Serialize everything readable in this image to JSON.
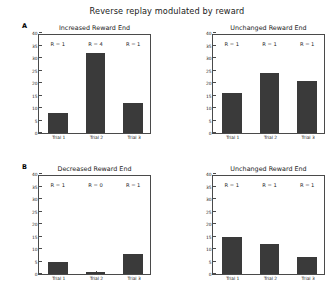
{
  "figure": {
    "suptitle": "Reverse replay modulated by reward",
    "bar_color": "#3a3a3a",
    "axis_color": "#4a4a4a",
    "background": "#ffffff"
  },
  "panels": [
    {
      "letter": "A",
      "position": "top-left",
      "title": "Increased Reward End",
      "ylabel": "No. of reverse replay events",
      "annotations": [
        "R = 1",
        "R = 4",
        "R = 1"
      ]
    },
    {
      "letter": "",
      "position": "top-right",
      "title": "Unchanged Reward End",
      "ylabel": "No. of reverse replay events",
      "annotations": [
        "R = 1",
        "R = 1",
        "R = 1"
      ]
    },
    {
      "letter": "B",
      "position": "bottom-left",
      "title": "Decreased Reward End",
      "ylabel": "No. of reverse replay events",
      "annotations": [
        "R = 1",
        "R = 0",
        "R = 1"
      ]
    },
    {
      "letter": "",
      "position": "bottom-right",
      "title": "Unchanged Reward End",
      "ylabel": "No. of reverse replay events",
      "annotations": [
        "R = 1",
        "R = 1",
        "R = 1"
      ]
    }
  ],
  "chart_data": [
    {
      "type": "bar",
      "panel": "A-left",
      "title": "Increased Reward End",
      "categories": [
        "Trial 1",
        "Trial 2",
        "Trial 3"
      ],
      "values": [
        8,
        32,
        12
      ],
      "annotations": [
        "R = 1",
        "R = 4",
        "R = 1"
      ],
      "xlabel": "",
      "ylabel": "No. of reverse replay events",
      "ylim": [
        0,
        40
      ],
      "yticks": [
        0,
        5,
        10,
        15,
        20,
        25,
        30,
        35,
        40
      ],
      "grid": false,
      "legend": null
    },
    {
      "type": "bar",
      "panel": "A-right",
      "title": "Unchanged Reward End",
      "categories": [
        "Trial 1",
        "Trial 2",
        "Trial 3"
      ],
      "values": [
        16,
        24,
        21
      ],
      "annotations": [
        "R = 1",
        "R = 1",
        "R = 1"
      ],
      "xlabel": "",
      "ylabel": "No. of reverse replay events",
      "ylim": [
        0,
        40
      ],
      "yticks": [
        0,
        5,
        10,
        15,
        20,
        25,
        30,
        35,
        40
      ],
      "grid": false,
      "legend": null
    },
    {
      "type": "bar",
      "panel": "B-left",
      "title": "Decreased Reward End",
      "categories": [
        "Trial 1",
        "Trial 2",
        "Trial 3"
      ],
      "values": [
        5,
        1,
        8
      ],
      "annotations": [
        "R = 1",
        "R = 0",
        "R = 1"
      ],
      "xlabel": "",
      "ylabel": "No. of reverse replay events",
      "ylim": [
        0,
        40
      ],
      "yticks": [
        0,
        5,
        10,
        15,
        20,
        25,
        30,
        35,
        40
      ],
      "grid": false,
      "legend": null
    },
    {
      "type": "bar",
      "panel": "B-right",
      "title": "Unchanged Reward End",
      "categories": [
        "Trial 1",
        "Trial 2",
        "Trial 3"
      ],
      "values": [
        15,
        12,
        7
      ],
      "annotations": [
        "R = 1",
        "R = 1",
        "R = 1"
      ],
      "xlabel": "",
      "ylabel": "No. of reverse replay events",
      "ylim": [
        0,
        40
      ],
      "yticks": [
        0,
        5,
        10,
        15,
        20,
        25,
        30,
        35,
        40
      ],
      "grid": false,
      "legend": null
    }
  ]
}
